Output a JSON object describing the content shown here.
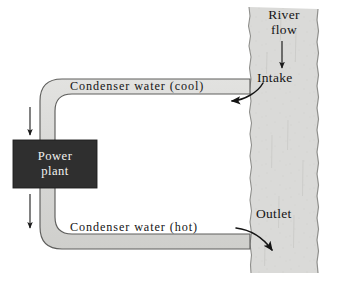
{
  "figure": {
    "type": "once-through-cooling-diagram",
    "background_color": "#ffffff"
  },
  "river": {
    "label_line1": "River",
    "label_line2": "flow",
    "fill_color": "#d9d9d7",
    "edge_color": "#9a9a97",
    "direction": "downward",
    "intake_label": "Intake",
    "outlet_label": "Outlet"
  },
  "pipes": {
    "fill_color": "#d9d9d7",
    "outline_color": "#5e5e5c",
    "cool_label": "Condenser water (cool)",
    "hot_label": "Condenser water (hot)"
  },
  "plant": {
    "line1": "Power",
    "line2": "plant",
    "fill_color": "#2f2f2f",
    "text_color": "#f2f2f0"
  },
  "arrows": {
    "river_flow_arrow": "down-arrow",
    "intake_arrow": "curved-arrow-left",
    "outlet_arrow": "curved-arrow-down-right",
    "plant_arrow_top": "down-arrow",
    "plant_arrow_bottom": "down-arrow",
    "color": "#1a1a1a"
  }
}
